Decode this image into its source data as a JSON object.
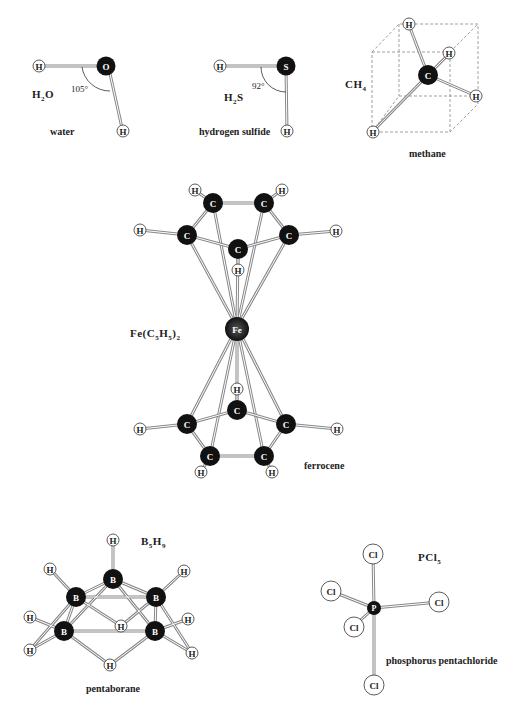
{
  "molecules": {
    "water": {
      "name": "water",
      "formula_main": "H",
      "formula_sub": "2",
      "formula_tail": "O",
      "angle": "105°",
      "atoms": [
        "H",
        "O",
        "H"
      ]
    },
    "hydrogen_sulfide": {
      "name": "hydrogen sulfide",
      "formula_main": "H",
      "formula_sub": "2",
      "formula_tail": "S",
      "angle": "92°",
      "atoms": [
        "H",
        "S",
        "H"
      ]
    },
    "methane": {
      "name": "methane",
      "formula_main": "CH",
      "formula_sub": "4",
      "atoms": [
        "C",
        "H",
        "H",
        "H",
        "H"
      ]
    },
    "ferrocene": {
      "name": "ferrocene",
      "formula_a": "Fe(C",
      "formula_sub1": "5",
      "formula_b": "H",
      "formula_sub2": "5",
      "formula_c": ")",
      "formula_sub3": "2",
      "center_atom": "Fe"
    },
    "pentaborane": {
      "name": "pentaborane",
      "formula_a": "B",
      "formula_sub1": "5",
      "formula_b": "H",
      "formula_sub2": "9"
    },
    "phosphorus_pentachloride": {
      "name": "phosphorus pentachloride",
      "formula_a": "PCl",
      "formula_sub1": "5",
      "center_atom": "P",
      "ligand": "Cl"
    }
  },
  "atom_symbols": {
    "H": "H",
    "O": "O",
    "S": "S",
    "C": "C",
    "Fe": "Fe",
    "B": "B",
    "P": "P",
    "Cl": "Cl"
  },
  "colors": {
    "dark_atom": "#111111",
    "light_atom": "#ffffff",
    "bond": "#888888",
    "text": "#222222"
  }
}
